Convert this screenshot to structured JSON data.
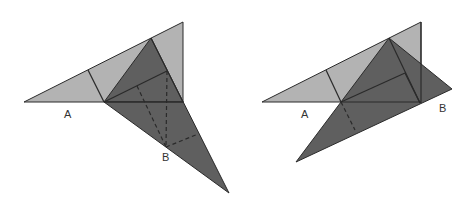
{
  "colors": {
    "light_fill": "#b3b3b3",
    "dark_fill": "#5f5f5f",
    "stroke": "#2a2a2a",
    "background": "#ffffff"
  },
  "figures": [
    {
      "name": "left-figure",
      "labels": {
        "a": "A",
        "b": "B"
      },
      "description": "Dark triangle folded down below the base line, with dashed fold lines meeting at B"
    },
    {
      "name": "right-figure",
      "labels": {
        "a": "A",
        "b": "B"
      },
      "description": "Dark triangle rotated so B lies on the extension of the base line, with a dashed fold line"
    }
  ]
}
